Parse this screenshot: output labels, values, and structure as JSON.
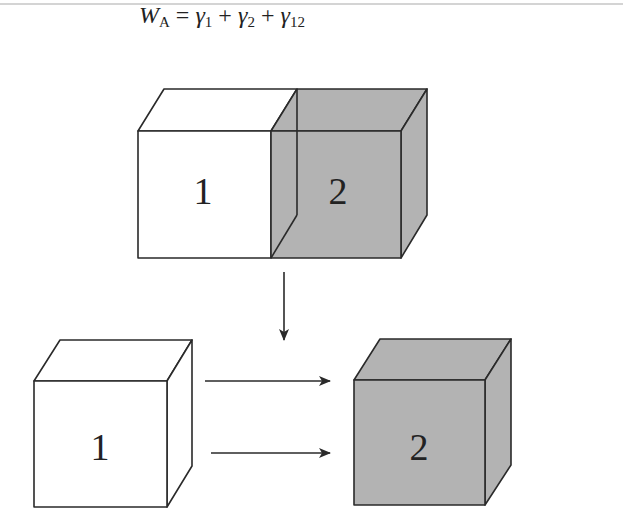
{
  "equation": {
    "lhs": "W",
    "lhs_sub": "A",
    "equals": "=",
    "terms": [
      {
        "symbol": "γ",
        "sub": "1"
      },
      {
        "symbol": "γ",
        "sub": "2"
      },
      {
        "symbol": "γ",
        "sub": "12"
      }
    ],
    "operator": "+"
  },
  "top_block": {
    "labels": [
      "1",
      "2"
    ],
    "left_fill": "#ffffff",
    "right_fill": "#b3b3b3"
  },
  "bottom_blocks": [
    {
      "label": "1",
      "fill": "#ffffff"
    },
    {
      "label": "2",
      "fill": "#b3b3b3"
    }
  ],
  "colors": {
    "stroke": "#2a2a2a",
    "gray": "#b3b3b3"
  }
}
